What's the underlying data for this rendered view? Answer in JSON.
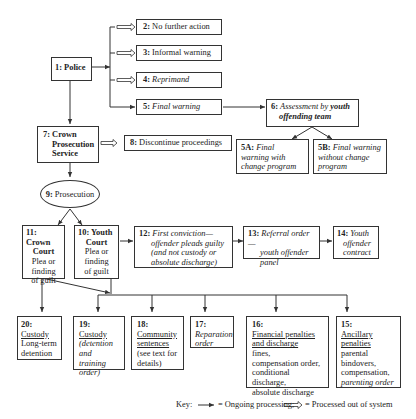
{
  "diagram": {
    "nodes": {
      "n1": {
        "num": "1:",
        "label": "Police"
      },
      "n2": {
        "num": "2:",
        "label": "No further action"
      },
      "n3": {
        "num": "3:",
        "label": "Informal warning"
      },
      "n4": {
        "num": "4:",
        "label": "Reprimand"
      },
      "n5": {
        "num": "5:",
        "label": "Final warning"
      },
      "n6": {
        "num": "6:",
        "label_a": "Assessment by",
        "label_b": "youth",
        "label_c": "offending team"
      },
      "n5a": {
        "num": "5A:",
        "label": "Final warning with change program"
      },
      "n5b": {
        "num": "5B:",
        "label": "Final warning without change program"
      },
      "n7": {
        "num": "7:",
        "label_a": "Crown",
        "label_b": "Prosecution",
        "label_c": "Service"
      },
      "n8": {
        "num": "8:",
        "label": "Discontinue proceedings"
      },
      "n9": {
        "num": "9:",
        "label": "Prosecution"
      },
      "n11": {
        "num": "11:",
        "title_a": "Crown",
        "title_b": "Court",
        "text_a": "Plea or",
        "text_b": "finding",
        "text_c": "of guilt"
      },
      "n10": {
        "num": "10:",
        "title_a": "Youth",
        "title_b": "Court",
        "text_a": "Plea or",
        "text_b": "finding",
        "text_c": "of guilt"
      },
      "n12": {
        "num": "12:",
        "label_a": "First conviction—",
        "label_b": "offender pleads guilty",
        "label_c": "(and not custody or",
        "label_d": "absolute discharge)"
      },
      "n13": {
        "num": "13:",
        "label_a": "Referral order—",
        "label_b": "youth offender",
        "label_c": "panel"
      },
      "n14": {
        "num": "14:",
        "label_a": "Youth",
        "label_b": "offender",
        "label_c": "contract"
      },
      "n20": {
        "num": "20:",
        "title": "Custody",
        "text_a": "Long-term",
        "text_b": "detention"
      },
      "n19": {
        "num": "19:",
        "title": "Custody",
        "text_a": "(detention",
        "text_b": "and training",
        "text_c": "order)"
      },
      "n18": {
        "num": "18:",
        "title_a": "Community",
        "title_b": "sentences",
        "text_a": "(see text for",
        "text_b": "details)"
      },
      "n17": {
        "num": "17:",
        "label_a": "Reparation",
        "label_b": "order"
      },
      "n16": {
        "num": "16:",
        "title_a": "Financial penalties",
        "title_b": "and discharge",
        "text_a": "fines,",
        "text_b": "compensation order,",
        "text_c": "conditional discharge,",
        "text_d": "absolute discharge"
      },
      "n15": {
        "num": "15:",
        "title_a": "Ancillary",
        "title_b": "penalties",
        "text_a": "parental",
        "text_b": "bindovers,",
        "text_c": "compensation,",
        "text_d": "parenting order"
      }
    },
    "key": {
      "prefix": "Key:",
      "ongoing": "= Ongoing processing;",
      "out": "= Processed out of system"
    }
  }
}
